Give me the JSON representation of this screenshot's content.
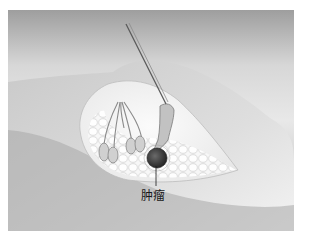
{
  "figure": {
    "labels": [
      {
        "id": "tumor",
        "text": "肿瘤"
      }
    ],
    "colors": {
      "background_top": "#d8d8d8",
      "background_bottom": "#a9a9a9",
      "skin": "#f4f4f4",
      "fat_lobules": "#fbfbfb",
      "tumor": "#3a3a3a",
      "needle": "#5a5a5a"
    }
  }
}
